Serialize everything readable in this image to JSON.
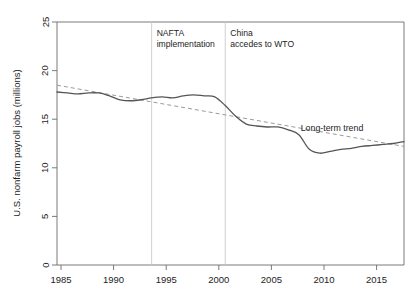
{
  "chart_data": {
    "type": "line",
    "title": "",
    "xlabel": "",
    "ylabel": "U.S. nonfarm payroll jobs (millions)",
    "xlim": [
      1985,
      2018
    ],
    "ylim": [
      0,
      25
    ],
    "xticks": [
      1985,
      1990,
      1995,
      2000,
      2005,
      2010,
      2015
    ],
    "yticks": [
      0,
      5,
      10,
      15,
      20,
      25
    ],
    "grid": false,
    "legend_position": "inline-annotation",
    "series": [
      {
        "name": "U.S. nonfarm payroll jobs",
        "style": "solid",
        "color": "#555555",
        "x": [
          1985,
          1986,
          1987,
          1988,
          1989,
          1990,
          1991,
          1992,
          1993,
          1994,
          1995,
          1996,
          1997,
          1998,
          1999,
          2000,
          2001,
          2002,
          2003,
          2004,
          2005,
          2006,
          2007,
          2008,
          2009,
          2010,
          2011,
          2012,
          2013,
          2014,
          2015,
          2016,
          2017,
          2018
        ],
        "values": [
          17.8,
          17.7,
          17.6,
          17.7,
          17.7,
          17.4,
          17.0,
          16.9,
          17.0,
          17.2,
          17.3,
          17.2,
          17.4,
          17.5,
          17.4,
          17.3,
          16.4,
          15.3,
          14.5,
          14.3,
          14.2,
          14.2,
          13.9,
          13.4,
          11.9,
          11.5,
          11.7,
          11.9,
          12.0,
          12.2,
          12.3,
          12.4,
          12.5,
          12.7
        ],
        "units": "millions"
      },
      {
        "name": "Long-term trend",
        "style": "dashed",
        "color": "#9a9a9a",
        "x": [
          1985,
          2018
        ],
        "values": [
          18.5,
          12.2
        ],
        "units": "millions"
      }
    ],
    "annotations": [
      {
        "id": "nafta",
        "lines": [
          "NAFTA",
          "implementation"
        ],
        "x_year": 1994,
        "type": "vertical-line-with-label"
      },
      {
        "id": "china-wto",
        "lines": [
          "China",
          "accedes to WTO"
        ],
        "x_year": 2001,
        "type": "vertical-line-with-label"
      },
      {
        "id": "long-term-trend",
        "lines": [
          "Long-term trend"
        ],
        "x_year": 2012,
        "y_value": 14.2,
        "type": "series-label"
      }
    ]
  },
  "axes": {
    "y_axis_title": "U.S. nonfarm payroll jobs (millions)",
    "y_tick_labels": [
      "0",
      "5",
      "10",
      "15",
      "20",
      "25"
    ],
    "x_tick_labels": [
      "1985",
      "1990",
      "1995",
      "2000",
      "2005",
      "2010",
      "2015"
    ]
  },
  "annotations": {
    "nafta_line1": "NAFTA",
    "nafta_line2": "implementation",
    "china_line1": "China",
    "china_line2": "accedes to WTO",
    "trend_label": "Long-term trend"
  },
  "colors": {
    "series_line": "#555555",
    "trend_line": "#9a9a9a",
    "axis": "#6b6b6b",
    "event_line": "#c9c9c9",
    "text": "#1d1d1d",
    "background": "#ffffff"
  }
}
